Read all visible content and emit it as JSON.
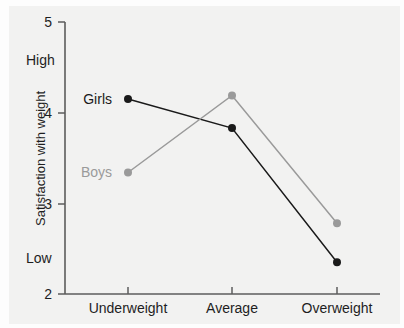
{
  "figure": {
    "background_color": "#f2f2f1",
    "paper_color": "#fdfdfd"
  },
  "chart_data": {
    "type": "line",
    "title": "",
    "xlabel": "",
    "ylabel": "Satisfaction with weight",
    "categories": [
      "Underweight",
      "Average",
      "Overweight"
    ],
    "ylim": [
      2,
      5
    ],
    "yticks": [
      2,
      3,
      4,
      5
    ],
    "ytick_labels": [
      "2",
      "3",
      "4",
      "5"
    ],
    "y_anchor_high": "High",
    "y_anchor_low": "Low",
    "grid": false,
    "legend_position": "inline-at-first-point",
    "series": [
      {
        "name": "Girls",
        "color": "#1a1a1a",
        "values": [
          4.15,
          3.83,
          2.35
        ]
      },
      {
        "name": "Boys",
        "color": "#9a9a9a",
        "values": [
          3.34,
          4.19,
          2.78
        ]
      }
    ]
  },
  "labels": {
    "ytick_5": "5",
    "ytick_4": "4",
    "ytick_3": "3",
    "ytick_2": "2",
    "high": "High",
    "low": "Low",
    "axis_title": "Satisfaction with weight",
    "cat_underweight": "Underweight",
    "cat_average": "Average",
    "cat_overweight": "Overweight",
    "series_girls": "Girls",
    "series_boys": "Boys"
  }
}
